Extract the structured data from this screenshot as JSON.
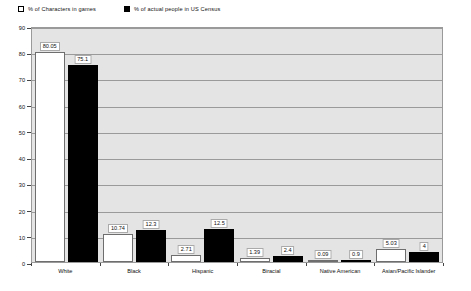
{
  "chart_data": {
    "type": "bar",
    "title": "",
    "subtitle": "",
    "xlabel": "",
    "ylabel": "",
    "ylim": [
      0,
      90
    ],
    "ytick_step": 10,
    "yticks": [
      0,
      10,
      20,
      30,
      40,
      50,
      60,
      70,
      80,
      90
    ],
    "grid": true,
    "legend_position": "top-left",
    "categories": [
      "White",
      "Black",
      "Hispanic",
      "Biracial",
      "Native American",
      "Asian/Pacific Islander"
    ],
    "series": [
      {
        "name": "% of Characters in games",
        "color": "#ffffff",
        "values": [
          80.05,
          10.74,
          2.71,
          1.39,
          0.09,
          5.03
        ],
        "labels": [
          "80.05",
          "10.74",
          "2.71",
          "1.39",
          "0.09",
          "5.03"
        ]
      },
      {
        "name": "% of actual people in US Census",
        "color": "#000000",
        "values": [
          75.1,
          12.3,
          12.5,
          2.4,
          0.9,
          4
        ],
        "labels": [
          "75.1",
          "12.3",
          "12.5",
          "2.4",
          "0.9",
          "4"
        ]
      }
    ]
  },
  "legend": {
    "items": [
      {
        "label": "% of Characters in games",
        "swatch": "open-square-icon"
      },
      {
        "label": "% of actual people in US Census",
        "swatch": "filled-square-icon"
      }
    ]
  }
}
